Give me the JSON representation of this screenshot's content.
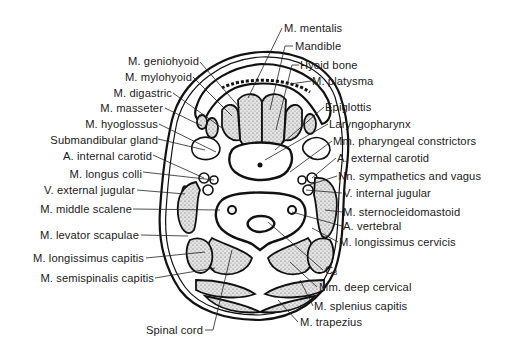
{
  "figure": {
    "vertebra_marker": {
      "letter": "C",
      "sub": "3"
    }
  },
  "labels_left": [
    {
      "id": "geniohyoid",
      "text": "M. geniohyoid"
    },
    {
      "id": "mylohyoid",
      "text": "M. mylohyoid"
    },
    {
      "id": "digastric",
      "text": "M. digastric"
    },
    {
      "id": "masseter",
      "text": "M. masseter"
    },
    {
      "id": "hyoglossus",
      "text": "M. hyoglossus"
    },
    {
      "id": "submandibular",
      "text": "Submandibular gland"
    },
    {
      "id": "int-carotid",
      "text": "A. internal carotid"
    },
    {
      "id": "longus-colli",
      "text": "M. longus colli"
    },
    {
      "id": "ext-jugular",
      "text": "V. external jugular"
    },
    {
      "id": "middle-scalene",
      "text": "M. middle scalene"
    },
    {
      "id": "levator",
      "text": "M. levator scapulae"
    },
    {
      "id": "longissimus-capitis",
      "text": "M. longissimus capitis"
    },
    {
      "id": "semispinalis",
      "text": "M. semispinalis capitis"
    },
    {
      "id": "spinal-cord",
      "text": "Spinal cord"
    }
  ],
  "labels_right": [
    {
      "id": "mentalis",
      "text": "M. mentalis"
    },
    {
      "id": "mandible",
      "text": "Mandible"
    },
    {
      "id": "hyoid",
      "text": "Hyoid bone"
    },
    {
      "id": "platysma",
      "text": "M. platysma"
    },
    {
      "id": "epiglottis",
      "text": "Epiglottis"
    },
    {
      "id": "laryngopharynx",
      "text": "Laryngopharynx"
    },
    {
      "id": "pharyngeal",
      "text": "Mm. pharyngeal constrictors"
    },
    {
      "id": "ext-carotid",
      "text": "A. external carotid"
    },
    {
      "id": "nerves",
      "text": "Nn. sympathetics and vagus"
    },
    {
      "id": "int-jugular",
      "text": "V. internal jugular"
    },
    {
      "id": "scm",
      "text": "M. sternocleidomastoid"
    },
    {
      "id": "vertebral",
      "text": "A. vertebral"
    },
    {
      "id": "longissimus-cervicis",
      "text": "M. longissimus cervicis"
    },
    {
      "id": "deep-cervical",
      "text": "Mm. deep cervical"
    },
    {
      "id": "splenius",
      "text": "M. splenius capitis"
    },
    {
      "id": "trapezius",
      "text": "M. trapezius"
    }
  ]
}
